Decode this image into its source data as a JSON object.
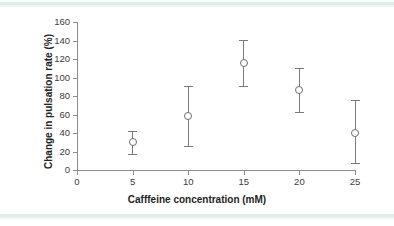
{
  "chart_data": {
    "type": "scatter",
    "title": "",
    "xlabel": "Cafffeine concentration (mM)",
    "ylabel": "Change in pulsation rate (%)",
    "xlim": [
      0,
      25
    ],
    "ylim": [
      0,
      160
    ],
    "xticks": [
      0,
      5,
      10,
      15,
      20,
      25
    ],
    "yticks": [
      0,
      20,
      40,
      60,
      80,
      100,
      120,
      140,
      160
    ],
    "grid": false,
    "legend": "none",
    "marker": "open-circle",
    "error_bars": "vertical",
    "x": [
      5,
      10,
      15,
      20,
      25
    ],
    "values": [
      30,
      58,
      116,
      86,
      40
    ],
    "err_low": [
      17,
      26,
      91,
      63,
      8
    ],
    "err_high": [
      42,
      91,
      141,
      110,
      76
    ],
    "points": [
      {
        "x": 5,
        "y": 30,
        "low": 17,
        "high": 42
      },
      {
        "x": 10,
        "y": 58,
        "low": 26,
        "high": 91
      },
      {
        "x": 15,
        "y": 116,
        "low": 91,
        "high": 141
      },
      {
        "x": 20,
        "y": 86,
        "low": 63,
        "high": 110
      },
      {
        "x": 25,
        "y": 40,
        "low": 8,
        "high": 76
      }
    ]
  },
  "colors": {
    "axis": "#8c8c8c",
    "marker_stroke": "#6e6e6e",
    "errorbar": "#7a7a7a",
    "tick_label": "#3d3d3d",
    "axis_title": "#232323",
    "rule": "#dfeee6",
    "background": "#ffffff"
  }
}
